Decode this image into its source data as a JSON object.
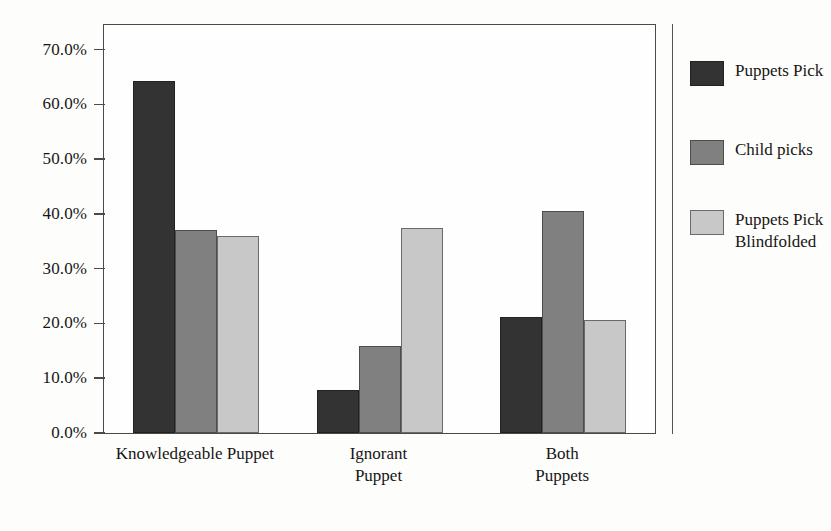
{
  "chart_data": {
    "type": "bar",
    "title": "",
    "subtitle": "",
    "xlabel": "",
    "ylabel": "",
    "categories": [
      "Knowledgeable Puppet",
      "Ignorant\nPuppet",
      "Both\nPuppets"
    ],
    "series": [
      {
        "name": "Puppets Pick",
        "color": "#333333",
        "values": [
          64.2,
          7.8,
          21.2
        ]
      },
      {
        "name": "Child picks",
        "color": "#808080",
        "values": [
          37.0,
          15.8,
          40.6
        ]
      },
      {
        "name": "Puppets Pick\nBlindfolded",
        "color": "#c8c8c8",
        "values": [
          36.0,
          37.4,
          20.7
        ]
      }
    ],
    "ylim": [
      0,
      74.5
    ],
    "yticks": [
      0,
      10,
      20,
      30,
      40,
      50,
      60,
      70
    ],
    "ytick_labels": [
      "0.0%",
      "10.0%",
      "20.0%",
      "30.0%",
      "40.0%",
      "50.0%",
      "60.0%",
      "70.0%"
    ],
    "grid": false,
    "legend_position": "right",
    "value_suffix": "%"
  },
  "colors": {
    "background": "#fdfdfb",
    "plot_background": "#fefefe",
    "axis": "#4a4a4a",
    "text": "#161616",
    "legend_divider": "#555555"
  }
}
